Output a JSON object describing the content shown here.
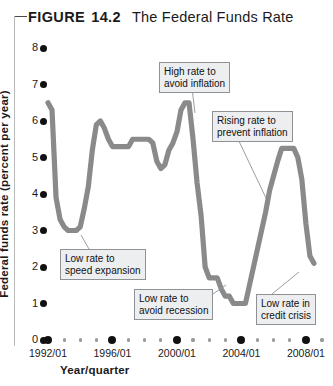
{
  "figure": {
    "label": "FIGURE",
    "number": "14.2",
    "title": "The Federal Funds Rate"
  },
  "chart_data": {
    "type": "line",
    "title": "The Federal Funds Rate",
    "xlabel": "Year/quarter",
    "ylabel": "Federal funds rate (percent per year)",
    "ylim": [
      0,
      8
    ],
    "xlim": [
      "1992/01",
      "2009/01"
    ],
    "grid": false,
    "legend": "none",
    "line_color": "#8a8a8a",
    "yticks": [
      0,
      1,
      2,
      3,
      4,
      5,
      6,
      7,
      8
    ],
    "ytick_labels": [
      "0",
      "1",
      "2",
      "3",
      "4",
      "5",
      "6",
      "7",
      "8"
    ],
    "xtick_labels": [
      "1992/01",
      "1996/01",
      "2000/01",
      "2004/01",
      "2008/01"
    ],
    "xtick_values": [
      1992,
      1996,
      2000,
      2004,
      2008
    ],
    "xminor_values": [
      1993,
      1994,
      1995,
      1997,
      1998,
      1999,
      2001,
      2002,
      2003,
      2005,
      2006,
      2007,
      2009
    ],
    "series": [
      {
        "name": "Federal funds rate",
        "x": [
          1992.0,
          1992.25,
          1992.5,
          1992.75,
          1993.0,
          1993.25,
          1993.5,
          1993.75,
          1994.0,
          1994.25,
          1994.5,
          1994.75,
          1995.0,
          1995.25,
          1995.5,
          1995.75,
          1996.0,
          1996.25,
          1996.5,
          1996.75,
          1997.0,
          1997.25,
          1997.5,
          1997.75,
          1998.0,
          1998.25,
          1998.5,
          1998.75,
          1999.0,
          1999.25,
          1999.5,
          1999.75,
          2000.0,
          2000.25,
          2000.5,
          2000.75,
          2001.0,
          2001.25,
          2001.5,
          2001.75,
          2002.0,
          2002.25,
          2002.5,
          2002.75,
          2003.0,
          2003.25,
          2003.5,
          2003.75,
          2004.0,
          2004.25,
          2004.5,
          2004.75,
          2005.0,
          2005.25,
          2005.5,
          2005.75,
          2006.0,
          2006.25,
          2006.5,
          2006.75,
          2007.0,
          2007.25,
          2007.5,
          2007.75,
          2008.0,
          2008.25,
          2008.5
        ],
        "y": [
          6.5,
          6.3,
          3.9,
          3.3,
          3.1,
          3.0,
          3.0,
          3.0,
          3.1,
          3.6,
          4.2,
          5.2,
          5.9,
          6.0,
          5.8,
          5.5,
          5.3,
          5.3,
          5.3,
          5.3,
          5.3,
          5.5,
          5.5,
          5.5,
          5.5,
          5.5,
          5.4,
          4.9,
          4.7,
          4.8,
          5.2,
          5.4,
          5.7,
          6.3,
          6.5,
          6.5,
          5.5,
          4.3,
          3.4,
          2.0,
          1.7,
          1.7,
          1.7,
          1.4,
          1.2,
          1.2,
          1.0,
          1.0,
          1.0,
          1.0,
          1.5,
          2.0,
          2.5,
          3.0,
          3.5,
          4.1,
          4.5,
          4.9,
          5.25,
          5.25,
          5.25,
          5.25,
          5.0,
          4.4,
          3.2,
          2.3,
          2.1
        ]
      }
    ],
    "annotations": [
      {
        "id": "high-rate-avoid-inflation",
        "lines": [
          "High rate to",
          "avoid inflation"
        ],
        "box": {
          "x": 159,
          "y": 62,
          "w": 70,
          "h": 26
        },
        "leader": {
          "x1": 192,
          "y1": 88,
          "x2": 195,
          "y2": 113
        }
      },
      {
        "id": "rising-rate-prevent-inflation",
        "lines": [
          "Rising rate to",
          "prevent inflation"
        ],
        "box": {
          "x": 212,
          "y": 111,
          "w": 74,
          "h": 26
        },
        "leader": {
          "x1": 237,
          "y1": 137,
          "x2": 266,
          "y2": 198
        }
      },
      {
        "id": "low-rate-speed-expansion",
        "lines": [
          "Low rate to",
          "speed expansion"
        ],
        "box": {
          "x": 60,
          "y": 249,
          "w": 79,
          "h": 26
        },
        "leader": {
          "x1": 89,
          "y1": 249,
          "x2": 81,
          "y2": 235
        }
      },
      {
        "id": "low-rate-avoid-recession",
        "lines": [
          "Low rate to",
          "avoid recession"
        ],
        "box": {
          "x": 134,
          "y": 289,
          "w": 76,
          "h": 26
        },
        "leader": {
          "x1": 210,
          "y1": 296,
          "x2": 226,
          "y2": 285
        }
      },
      {
        "id": "low-rate-credit-crisis",
        "lines": [
          "Low rate in",
          "credit crisis"
        ],
        "box": {
          "x": 256,
          "y": 294,
          "w": 62,
          "h": 26
        },
        "leader": {
          "x1": 272,
          "y1": 294,
          "x2": 299,
          "y2": 272
        }
      }
    ]
  }
}
